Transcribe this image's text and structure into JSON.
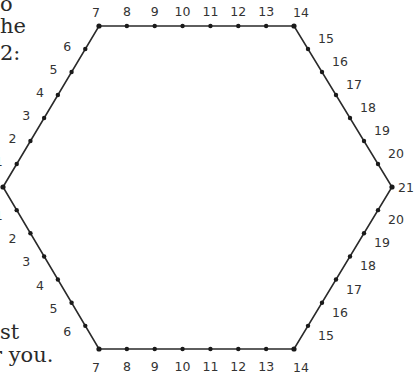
{
  "worksheet": {
    "text_fragments": {
      "top": [
        {
          "text": "o",
          "x": 0,
          "y": -6
        },
        {
          "text": "he",
          "x": 0,
          "y": 16
        },
        {
          "text": "2:",
          "x": 0,
          "y": 43
        }
      ],
      "bottom": [
        {
          "text": "st",
          "x": 0,
          "y": 322
        },
        {
          "text": "r you.",
          "x": -8,
          "y": 345
        }
      ]
    },
    "line_color": "#2a2a2a",
    "dot_color": "#1a1a1a",
    "hexagon_vertices": [
      {
        "label": "",
        "x": 3,
        "y": 187
      },
      {
        "label": "7",
        "x": 99,
        "y": 26
      },
      {
        "label": "14",
        "x": 294,
        "y": 26
      },
      {
        "label": "21",
        "x": 392,
        "y": 187
      },
      {
        "label": "14",
        "x": 294,
        "y": 349
      },
      {
        "label": "7",
        "x": 99,
        "y": 349
      }
    ],
    "edges": [
      {
        "name": "upper-left",
        "labels": [
          "1",
          "2",
          "3",
          "4",
          "5",
          "6"
        ],
        "label_dx": -14,
        "label_dy": 2,
        "anchor": "end"
      },
      {
        "name": "top",
        "labels": [
          "8",
          "9",
          "10",
          "11",
          "12",
          "13"
        ],
        "label_dx": 0,
        "label_dy": -10,
        "anchor": "middle"
      },
      {
        "name": "upper-right",
        "labels": [
          "15",
          "16",
          "17",
          "18",
          "19",
          "20"
        ],
        "label_dx": 10,
        "label_dy": -6,
        "anchor": "start"
      },
      {
        "name": "lower-right",
        "labels": [
          "20",
          "19",
          "18",
          "17",
          "16",
          "15"
        ],
        "label_dx": 10,
        "label_dy": 14,
        "anchor": "start"
      },
      {
        "name": "bottom",
        "labels": [
          "13",
          "12",
          "11",
          "10",
          "9",
          "8"
        ],
        "label_dx": 0,
        "label_dy": 22,
        "anchor": "middle"
      },
      {
        "name": "lower-left",
        "labels": [
          "6",
          "5",
          "4",
          "3",
          "2",
          "1"
        ],
        "label_dx": -14,
        "label_dy": 10,
        "anchor": "end"
      }
    ],
    "corner_labels": [
      {
        "text": "7",
        "x": 96,
        "y": 17,
        "anchor": "middle"
      },
      {
        "text": "14",
        "x": 301,
        "y": 17,
        "anchor": "middle"
      },
      {
        "text": "21",
        "x": 398,
        "y": 192,
        "anchor": "start"
      },
      {
        "text": "14",
        "x": 301,
        "y": 372,
        "anchor": "middle"
      },
      {
        "text": "7",
        "x": 96,
        "y": 372,
        "anchor": "middle"
      }
    ]
  }
}
